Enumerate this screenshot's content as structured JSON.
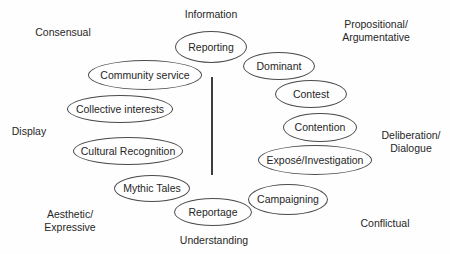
{
  "diagram": {
    "figure_type": "conceptual-quadrant-diagram",
    "colors": {
      "background": "#fefefe",
      "stroke": "#4b4b4b",
      "text": "#262626"
    },
    "region_labels": {
      "top_center": "Information",
      "top_left": "Consensual",
      "top_right": "Propositional/\nArgumentative",
      "mid_left": "Display",
      "mid_right": "Deliberation/\nDialogue",
      "bottom_left": "Aesthetic/\nExpressive",
      "bottom_center": "Understanding",
      "bottom_right": "Conflictual"
    },
    "nodes": [
      {
        "label": "Reporting"
      },
      {
        "label": "Community service"
      },
      {
        "label": "Collective interests"
      },
      {
        "label": "Cultural Recognition"
      },
      {
        "label": "Mythic Tales"
      },
      {
        "label": "Reportage"
      },
      {
        "label": "Dominant"
      },
      {
        "label": "Contest"
      },
      {
        "label": "Contention"
      },
      {
        "label": "Exposé/Investigation"
      },
      {
        "label": "Campaigning"
      }
    ],
    "divider": {
      "orientation": "vertical",
      "x": 212,
      "y_top": 77,
      "y_bottom": 175
    }
  }
}
